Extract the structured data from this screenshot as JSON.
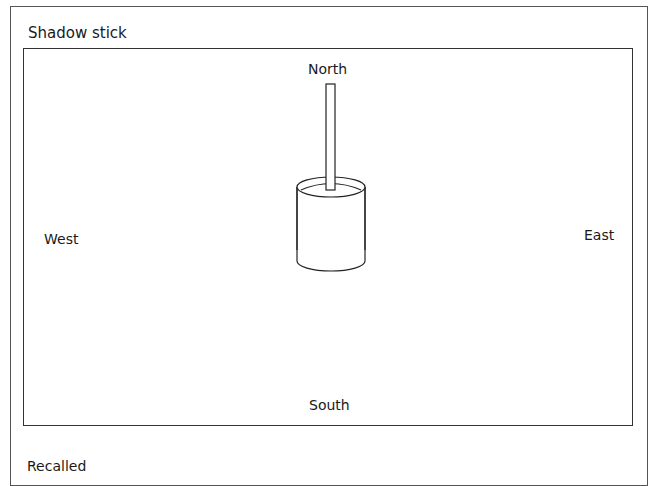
{
  "title": "Shadow stick",
  "compass": {
    "north": "North",
    "south": "South",
    "west": "West",
    "east": "East"
  },
  "diagram": {
    "object": "stick in a cylindrical pot",
    "stroke_color": "#222222"
  },
  "footer": {
    "partial_text": "Recalled"
  }
}
